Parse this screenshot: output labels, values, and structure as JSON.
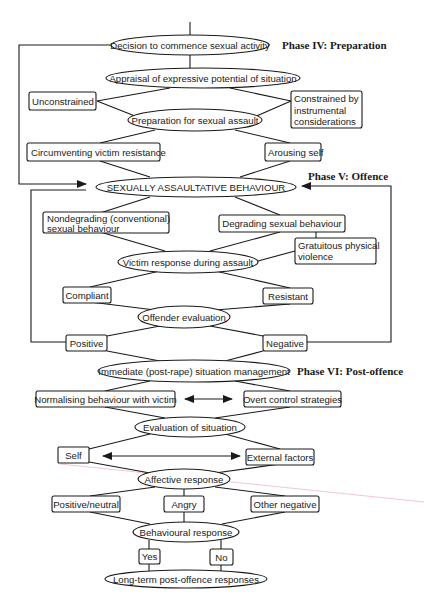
{
  "diagram": {
    "phases": [
      {
        "id": "phase4",
        "label": "Phase IV: Preparation"
      },
      {
        "id": "phase5",
        "label": "Phase V: Offence"
      },
      {
        "id": "phase6",
        "label": "Phase VI: Post-offence"
      }
    ],
    "nodes": {
      "decision": "Decision to commence sexual activity",
      "appraisal": "Appraisal of expressive potential of situation",
      "unconstrained": "Unconstrained",
      "constrained_1": "Constrained by",
      "constrained_2": "instrumental",
      "constrained_3": "considerations",
      "preparation": "Preparation for sexual assault",
      "circumventing": "Circumventing victim resistance",
      "arousing": "Arousing self",
      "assaultative": "SEXUALLY ASSAULTATIVE BEHAVIOUR",
      "nondegrading_1": "Nondegrading (conventional)",
      "nondegrading_2": "sexual behaviour",
      "degrading": "Degrading sexual behaviour",
      "gratuitous_1": "Gratuitous physical",
      "gratuitous_2": "violence",
      "victim_response": "Victim response during assault",
      "compliant": "Compliant",
      "resistant": "Resistant",
      "offender_eval": "Offender evaluation",
      "positive": "Positive",
      "negative": "Negative",
      "immediate": "Immediate (post-rape) situation management",
      "normalising": "Normalising behaviour with victim",
      "overt": "Overt control strategies",
      "eval_situation": "Evaluation of situation",
      "self": "Self",
      "external": "External factors",
      "affective": "Affective response",
      "pos_neutral": "Positive/neutral",
      "angry": "Angry",
      "other_negative": "Other negative",
      "behavioural": "Behavioural response",
      "yes": "Yes",
      "no": "No",
      "longterm": "Long-term post-offence responses"
    }
  }
}
